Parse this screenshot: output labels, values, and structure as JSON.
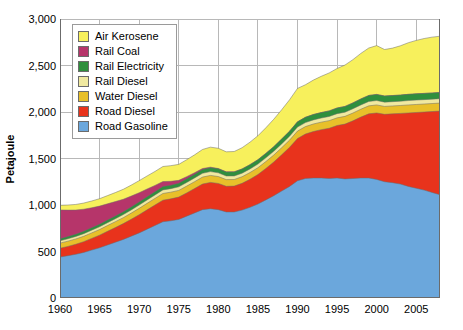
{
  "chart_data": {
    "type": "area",
    "stacked": true,
    "title": "",
    "xlabel": "",
    "ylabel": "Petajoule",
    "xlim": [
      1960,
      2008
    ],
    "ylim": [
      0,
      3000
    ],
    "yticks": [
      "0",
      "500",
      "1,000",
      "1,500",
      "2,000",
      "2,500",
      "3,000"
    ],
    "ytick_values": [
      0,
      500,
      1000,
      1500,
      2000,
      2500,
      3000
    ],
    "xticks": [
      "1960",
      "1965",
      "1970",
      "1975",
      "1980",
      "1985",
      "1990",
      "1995",
      "2000",
      "2005"
    ],
    "xtick_values": [
      1960,
      1965,
      1970,
      1975,
      1980,
      1985,
      1990,
      1995,
      2000,
      2005
    ],
    "grid": true,
    "grid_color": "#b8b8b8",
    "legend_position": "top-left",
    "x": [
      1960,
      1961,
      1962,
      1963,
      1964,
      1965,
      1966,
      1967,
      1968,
      1969,
      1970,
      1971,
      1972,
      1973,
      1974,
      1975,
      1976,
      1977,
      1978,
      1979,
      1980,
      1981,
      1982,
      1983,
      1984,
      1985,
      1986,
      1987,
      1988,
      1989,
      1990,
      1991,
      1992,
      1993,
      1994,
      1995,
      1996,
      1997,
      1998,
      1999,
      2000,
      2001,
      2002,
      2003,
      2004,
      2005,
      2006,
      2007,
      2008
    ],
    "series": [
      {
        "name": "Road Gasoline",
        "color": "#6ba7dc",
        "values": [
          440,
          455,
          470,
          490,
          515,
          540,
          570,
          600,
          630,
          665,
          700,
          740,
          780,
          820,
          830,
          845,
          880,
          915,
          950,
          960,
          950,
          925,
          925,
          945,
          975,
          1010,
          1055,
          1100,
          1150,
          1200,
          1260,
          1285,
          1290,
          1290,
          1285,
          1290,
          1280,
          1285,
          1290,
          1290,
          1275,
          1250,
          1240,
          1225,
          1200,
          1180,
          1160,
          1135,
          1110
        ]
      },
      {
        "name": "Road Diesel",
        "color": "#e8331c",
        "values": [
          95,
          100,
          108,
          116,
          126,
          136,
          147,
          158,
          170,
          182,
          196,
          208,
          220,
          232,
          236,
          240,
          250,
          262,
          275,
          283,
          282,
          276,
          278,
          288,
          302,
          318,
          338,
          362,
          390,
          420,
          455,
          478,
          500,
          520,
          540,
          565,
          590,
          620,
          655,
          690,
          715,
          725,
          740,
          760,
          790,
          815,
          840,
          870,
          900
        ]
      },
      {
        "name": "Water Diesel",
        "color": "#e8c02a",
        "values": [
          55,
          56,
          57,
          58,
          59,
          60,
          62,
          63,
          64,
          66,
          68,
          70,
          71,
          72,
          72,
          72,
          73,
          74,
          75,
          75,
          74,
          72,
          71,
          71,
          72,
          73,
          74,
          75,
          76,
          78,
          80,
          80,
          81,
          81,
          82,
          82,
          83,
          84,
          85,
          86,
          86,
          85,
          85,
          85,
          86,
          86,
          86,
          86,
          86
        ]
      },
      {
        "name": "Rail Diesel",
        "color": "#f0e9a0",
        "values": [
          25,
          26,
          27,
          28,
          29,
          30,
          31,
          32,
          33,
          34,
          35,
          36,
          37,
          38,
          38,
          38,
          39,
          40,
          41,
          41,
          40,
          39,
          38,
          38,
          39,
          39,
          40,
          40,
          41,
          42,
          43,
          43,
          44,
          44,
          45,
          45,
          45,
          46,
          46,
          47,
          47,
          46,
          46,
          46,
          47,
          47,
          47,
          47,
          47
        ]
      },
      {
        "name": "Rail Electricity",
        "color": "#2f8f3d",
        "values": [
          22,
          23,
          24,
          25,
          26,
          27,
          28,
          29,
          30,
          31,
          33,
          34,
          35,
          36,
          37,
          38,
          39,
          40,
          41,
          42,
          43,
          43,
          44,
          45,
          46,
          47,
          48,
          50,
          52,
          54,
          56,
          57,
          58,
          59,
          60,
          61,
          62,
          63,
          64,
          65,
          66,
          66,
          66,
          66,
          67,
          67,
          67,
          67,
          67
        ]
      },
      {
        "name": "Rail Coal",
        "color": "#b6356a",
        "values": [
          310,
          285,
          260,
          238,
          215,
          195,
          175,
          155,
          135,
          118,
          100,
          84,
          68,
          54,
          42,
          32,
          24,
          16,
          10,
          6,
          3,
          2,
          1,
          1,
          0,
          0,
          0,
          0,
          0,
          0,
          0,
          0,
          0,
          0,
          0,
          0,
          0,
          0,
          0,
          0,
          0,
          0,
          0,
          0,
          0,
          0,
          0,
          0,
          0
        ]
      },
      {
        "name": "Air Kerosene",
        "color": "#f7f05c",
        "values": [
          50,
          55,
          60,
          66,
          73,
          80,
          88,
          97,
          107,
          118,
          130,
          140,
          150,
          162,
          168,
          172,
          182,
          192,
          205,
          215,
          218,
          215,
          218,
          228,
          242,
          258,
          275,
          295,
          315,
          338,
          360,
          350,
          370,
          390,
          408,
          425,
          445,
          465,
          490,
          510,
          525,
          500,
          510,
          530,
          555,
          575,
          590,
          600,
          605
        ]
      }
    ]
  },
  "legend": {
    "items": [
      {
        "label": "Air Kerosene",
        "color": "#f7f05c"
      },
      {
        "label": "Rail Coal",
        "color": "#b6356a"
      },
      {
        "label": "Rail Electricity",
        "color": "#2f8f3d"
      },
      {
        "label": "Rail Diesel",
        "color": "#f0e9a0"
      },
      {
        "label": "Water Diesel",
        "color": "#e8c02a"
      },
      {
        "label": "Road Diesel",
        "color": "#e8331c"
      },
      {
        "label": "Road Gasoline",
        "color": "#6ba7dc"
      }
    ]
  }
}
